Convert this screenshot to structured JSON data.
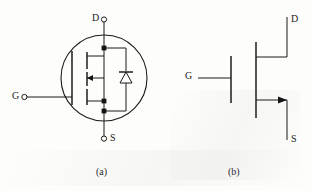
{
  "figure": {
    "kind": "circuit-diagram",
    "background_color": "#fdfdfc",
    "line_color": "#1a1a1a"
  },
  "diagram_a": {
    "caption": "(a)",
    "enclosure": "circle",
    "terminals": [
      {
        "id": "drain",
        "label": "D",
        "position": "top",
        "has_terminal_ring": true
      },
      {
        "id": "gate",
        "label": "G",
        "position": "left",
        "has_terminal_ring": true
      },
      {
        "id": "source",
        "label": "S",
        "position": "bottom",
        "has_terminal_ring": true
      }
    ],
    "components": [
      {
        "id": "gate-bar",
        "type": "vertical-bar"
      },
      {
        "id": "channel-line",
        "type": "vertical-bar-segmented"
      },
      {
        "id": "channel-arrow",
        "type": "arrow",
        "direction": "right"
      },
      {
        "id": "body-diode",
        "type": "diode",
        "direction": "up"
      },
      {
        "id": "junction-dots",
        "type": "node",
        "count": 3
      }
    ]
  },
  "diagram_b": {
    "caption": "(b)",
    "enclosure": "none",
    "terminals": [
      {
        "id": "drain",
        "label": "D",
        "position": "top-right",
        "has_terminal_ring": false
      },
      {
        "id": "gate",
        "label": "G",
        "position": "left",
        "has_terminal_ring": false
      },
      {
        "id": "source",
        "label": "S",
        "position": "bottom-right",
        "has_terminal_ring": false
      }
    ],
    "components": [
      {
        "id": "gate-bar",
        "type": "vertical-bar"
      },
      {
        "id": "channel-line",
        "type": "vertical-bar"
      },
      {
        "id": "channel-arrow",
        "type": "arrow",
        "direction": "right"
      }
    ]
  },
  "labels": {
    "a_drain": "D",
    "a_gate": "G",
    "a_source": "S",
    "a_caption": "(a)",
    "b_drain": "D",
    "b_gate": "G",
    "b_source": "S",
    "b_caption": "(b)"
  }
}
